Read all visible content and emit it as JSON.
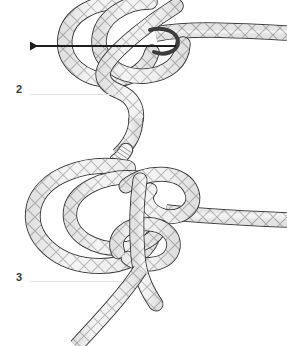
{
  "figure": {
    "background_color": "#ffffff",
    "rope_outline_color": "#3c3c3c",
    "rope_fill_light": "#f2f2f2",
    "rope_fill_mid": "#d8d8d8",
    "rope_fill_shade": "#b9b9b9",
    "rope_weave_color": "#9a9a9a",
    "arrow_color": "#1e1e1e",
    "rule_color": "#e2e2e2",
    "label_color": "#3a3a3a"
  },
  "steps": [
    {
      "number": "2",
      "label_x": 16,
      "label_y": 84,
      "rule_x": 30,
      "rule_y": 94,
      "rule_width": 92,
      "has_arrow": true,
      "arrow_direction": "left",
      "arrow_tip_x": 22,
      "arrow_tail_x": 176,
      "arrow_y": 46
    },
    {
      "number": "3",
      "label_x": 16,
      "label_y": 272,
      "rule_x": 30,
      "rule_y": 281,
      "rule_width": 92,
      "has_arrow": false,
      "arrow_direction": "",
      "arrow_tip_x": 0,
      "arrow_tail_x": 0,
      "arrow_y": 0
    }
  ]
}
